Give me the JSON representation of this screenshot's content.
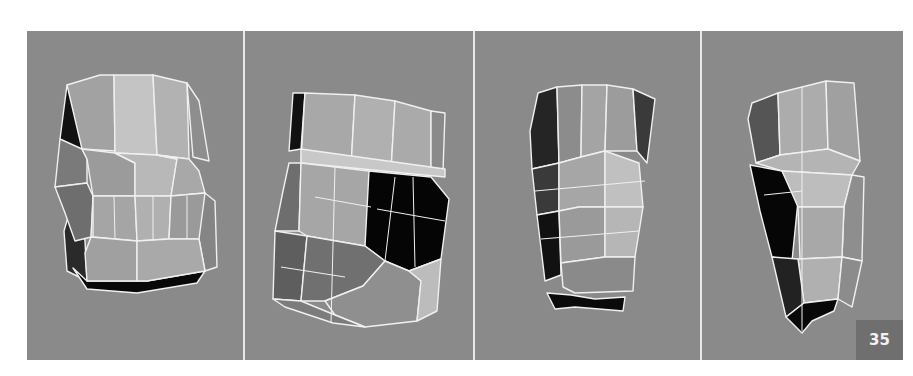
{
  "figure": {
    "background_color": "#8a8a8a",
    "divider_color": "#e8e8e8",
    "wire_color": "#f0f0f0",
    "panels": [
      {
        "id": 1,
        "view": "front"
      },
      {
        "id": 2,
        "view": "three-quarter"
      },
      {
        "id": 3,
        "view": "back"
      },
      {
        "id": 4,
        "view": "side"
      }
    ],
    "badge": {
      "label": "35",
      "bg_color": "#6f6f6f",
      "text_color": "#f2f2f2"
    }
  }
}
